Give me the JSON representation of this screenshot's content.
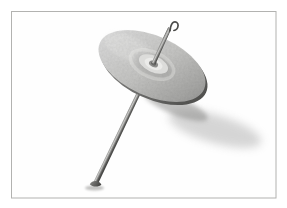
{
  "scene": {
    "subject": "drop-spindle",
    "background": "#ffffff",
    "frame": {
      "fill": "#fefefe",
      "border_color": "#b2b2b0"
    },
    "colors": {
      "disc_light": "#dedede",
      "disc_mid": "#c8c8c6",
      "disc_dark": "#a8a8a6",
      "disc_edge": "#909090",
      "disc_highlight": "#f0f0ee",
      "rim_light": "#8a8a88",
      "rim_dark": "#4a4a48",
      "ring_highlight": "#e9e9e7",
      "hub_shade": "#9a9a98",
      "hub_outer": "#dcdcda",
      "hub_inner_ring": "#ebebe9",
      "hub_center": "#8e8e8c",
      "hub_collar": "#6a6a68",
      "shaft_edge": "#777775",
      "shaft_highlight": "#c9c9c7",
      "shaft_shade": "#5e5e5c",
      "shaft_dark": "#454543",
      "hook": "#4a4a48",
      "tip_light": "#8c8c8a",
      "tip_dark": "#3f3f3d",
      "shadow_soft": "#9a9a9a",
      "shadow_near": "#868684",
      "grain": "#000000"
    }
  }
}
